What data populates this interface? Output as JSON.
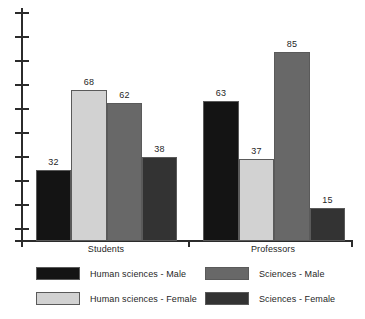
{
  "chart_data": {
    "type": "bar",
    "title": "",
    "subtitle": "",
    "xlabel": "",
    "ylabel": "",
    "categories": [
      "Students",
      "Professors"
    ],
    "series": [
      {
        "name": "Human sciences - Male",
        "color": "#141414",
        "values": [
          32,
          63
        ]
      },
      {
        "name": "Human sciences - Female",
        "color": "#d2d2d2",
        "values": [
          68,
          37
        ]
      },
      {
        "name": "Sciences - Male",
        "color": "#686868",
        "values": [
          62,
          85
        ]
      },
      {
        "name": "Sciences - Female",
        "color": "#333333",
        "values": [
          38,
          15
        ]
      }
    ],
    "ylim": [
      0,
      100
    ],
    "y_tick_labels": [],
    "y_tick_count": 10,
    "grid": false,
    "legend_position": "bottom",
    "annotations": [
      "32",
      "68",
      "62",
      "38",
      "63",
      "37",
      "85",
      "15"
    ]
  },
  "plot": {
    "bars": [
      {
        "label": "Human sciences - Male",
        "group": "Students",
        "value": "32",
        "color": "#141414",
        "x": 36,
        "width": 35
      },
      {
        "label": "Human sciences - Female",
        "group": "Students",
        "value": "68",
        "color": "#d2d2d2",
        "x": 71,
        "width": 36
      },
      {
        "label": "Sciences - Male",
        "group": "Students",
        "value": "62",
        "color": "#686868",
        "x": 107,
        "width": 35
      },
      {
        "label": "Sciences - Female",
        "group": "Students",
        "value": "38",
        "color": "#333333",
        "x": 142,
        "width": 35
      },
      {
        "label": "Human sciences - Male",
        "group": "Professors",
        "value": "63",
        "color": "#141414",
        "x": 203,
        "width": 36
      },
      {
        "label": "Human sciences - Female",
        "group": "Professors",
        "value": "37",
        "color": "#d2d2d2",
        "x": 239,
        "width": 35
      },
      {
        "label": "Sciences - Male",
        "group": "Professors",
        "value": "85",
        "color": "#686868",
        "x": 274,
        "width": 36
      },
      {
        "label": "Sciences - Female",
        "group": "Professors",
        "value": "15",
        "color": "#333333",
        "x": 310,
        "width": 35
      }
    ],
    "group_labels": [
      {
        "text": "Students",
        "center": 106
      },
      {
        "text": "Professors",
        "center": 273
      }
    ],
    "y_ticks": [
      12,
      36,
      60,
      84,
      108,
      132,
      156,
      180,
      204,
      228
    ],
    "x_ticks": [
      21,
      188,
      351
    ]
  },
  "legend": {
    "items": [
      {
        "label": "Human sciences - Male",
        "color": "#141414",
        "x": 36,
        "y": 5
      },
      {
        "label": "Human sciences - Female",
        "color": "#d2d2d2",
        "x": 36,
        "y": 30
      },
      {
        "label": "Sciences - Male",
        "color": "#686868",
        "x": 205,
        "y": 5
      },
      {
        "label": "Sciences - Female",
        "color": "#333333",
        "x": 205,
        "y": 30
      }
    ]
  }
}
